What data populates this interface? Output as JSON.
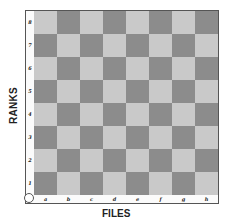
{
  "axis_titles": {
    "ranks": "RANKS",
    "files": "FILES"
  },
  "ranks": [
    "8",
    "7",
    "6",
    "5",
    "4",
    "3",
    "2",
    "1"
  ],
  "files": [
    "a",
    "b",
    "c",
    "d",
    "e",
    "f",
    "g",
    "h"
  ],
  "board": {
    "size": 8,
    "bottom_left_square": "a1",
    "bottom_left_color": "dark"
  },
  "colors": {
    "light_square": "#c9c9c9",
    "dark_square": "#8c8c8c",
    "border": "#555555"
  },
  "corner_marker": "circle"
}
